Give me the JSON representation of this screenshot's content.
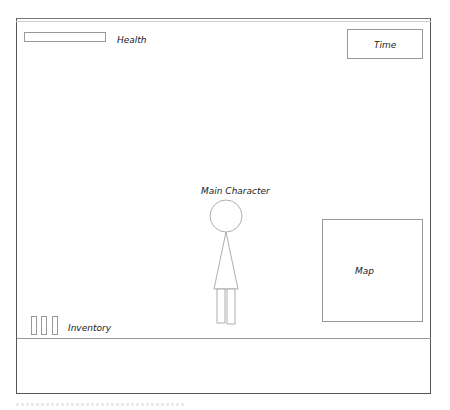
{
  "hud": {
    "health": {
      "label": "Health",
      "value_percent": null
    },
    "time": {
      "label": "Time"
    },
    "map": {
      "label": "Map"
    },
    "inventory": {
      "label": "Inventory",
      "slots": 3
    }
  },
  "scene": {
    "main_character": {
      "label": "Main Character"
    }
  },
  "colors": {
    "frame": "#555555",
    "outline": "#999999",
    "text": "#222222",
    "background": "#ffffff"
  }
}
